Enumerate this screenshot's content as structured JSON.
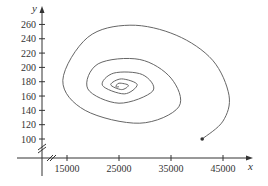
{
  "chart_data": {
    "type": "line",
    "title": "",
    "xlabel": "x",
    "ylabel": "y",
    "xlim": [
      10000,
      50000
    ],
    "ylim": [
      80,
      270
    ],
    "x_ticks": [
      15000,
      25000,
      35000,
      45000
    ],
    "x_tick_labels": [
      "15000",
      "25000",
      "35000",
      "45000"
    ],
    "y_ticks": [
      100,
      120,
      140,
      160,
      180,
      200,
      220,
      240,
      260
    ],
    "y_tick_labels": [
      "100",
      "120",
      "140",
      "160",
      "180",
      "200",
      "220",
      "240",
      "260"
    ],
    "grid": false,
    "legend": null,
    "axis_breaks": [
      "x",
      "y"
    ],
    "series": [
      {
        "name": "phase trajectory",
        "description": "Spiral trajectory starting at the marked point and spiraling inward counterclockwise toward an equilibrium",
        "start_point": {
          "x": 41000,
          "y": 100
        },
        "equilibrium": {
          "x": 25000,
          "y": 173
        },
        "points": [
          {
            "x": 41000,
            "y": 100
          },
          {
            "x": 45000,
            "y": 125
          },
          {
            "x": 46150,
            "y": 161
          },
          {
            "x": 43000,
            "y": 210
          },
          {
            "x": 36000,
            "y": 245
          },
          {
            "x": 27100,
            "y": 259
          },
          {
            "x": 19000,
            "y": 242
          },
          {
            "x": 14200,
            "y": 182
          },
          {
            "x": 18500,
            "y": 140
          },
          {
            "x": 29000,
            "y": 122
          },
          {
            "x": 36500,
            "y": 145
          },
          {
            "x": 35000,
            "y": 185
          },
          {
            "x": 29000,
            "y": 211
          },
          {
            "x": 21000,
            "y": 205
          },
          {
            "x": 19000,
            "y": 170
          },
          {
            "x": 25000,
            "y": 150
          },
          {
            "x": 31500,
            "y": 167
          },
          {
            "x": 29500,
            "y": 190
          },
          {
            "x": 24000,
            "y": 192
          },
          {
            "x": 21800,
            "y": 175
          },
          {
            "x": 26000,
            "y": 163
          },
          {
            "x": 28500,
            "y": 176
          },
          {
            "x": 25500,
            "y": 184
          },
          {
            "x": 23400,
            "y": 176
          },
          {
            "x": 25500,
            "y": 169
          },
          {
            "x": 26800,
            "y": 175
          },
          {
            "x": 25000,
            "y": 178
          },
          {
            "x": 24400,
            "y": 173
          },
          {
            "x": 25000,
            "y": 173
          }
        ]
      }
    ]
  },
  "axes": {
    "x_label": "x",
    "y_label": "y"
  }
}
